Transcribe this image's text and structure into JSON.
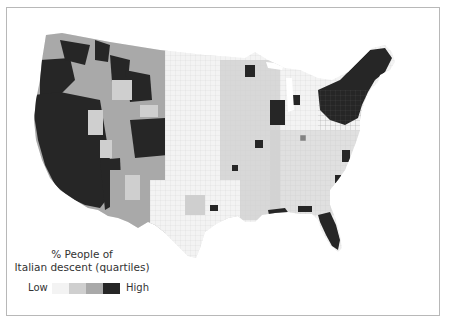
{
  "map": {
    "title": "% People of Italian descent (quartiles)",
    "subject": "United States counties choropleth"
  },
  "legend": {
    "title_line1": "% People of",
    "title_line2": "Italian descent (quartiles)",
    "low_label": "Low",
    "high_label": "High",
    "classes": [
      {
        "quartile": 1,
        "color": "#f3f3f3"
      },
      {
        "quartile": 2,
        "color": "#cfcfcf"
      },
      {
        "quartile": 3,
        "color": "#a9a9a9"
      },
      {
        "quartile": 4,
        "color": "#262626"
      }
    ]
  },
  "colors": {
    "q1": "#f3f3f3",
    "q2": "#cfcfcf",
    "q3": "#a9a9a9",
    "q4": "#262626",
    "border": "#b8b8b8"
  }
}
